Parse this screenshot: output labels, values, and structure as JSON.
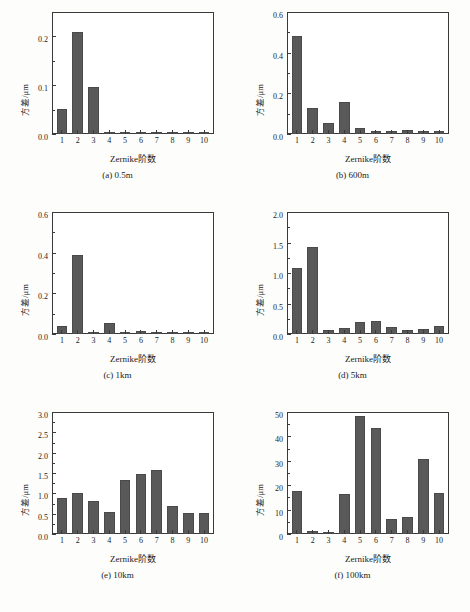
{
  "figure": {
    "background": "#fdfdfc",
    "bar_color": "#595959",
    "axis_color": "#3a3a3a",
    "xlabel": "Zernike阶数",
    "ylabel": "方差/μm",
    "caption": ""
  },
  "chart_data": [
    {
      "type": "bar",
      "panel": "(a)",
      "subcaption": "(a) 0.5m",
      "title": "",
      "xlabel": "Zernike阶数",
      "ylabel": "方差/μm",
      "categories": [
        "1",
        "2",
        "3",
        "4",
        "5",
        "6",
        "7",
        "8",
        "9",
        "10"
      ],
      "values": [
        0.051,
        0.21,
        0.097,
        0.0,
        0.002,
        0.0,
        0.0,
        0.0,
        0.0,
        0.0
      ],
      "ylim": [
        0,
        0.25
      ],
      "yticks": [
        0.0,
        0.1,
        0.2
      ],
      "yticklabels": [
        "0.0",
        "0.1",
        "0.2"
      ],
      "yminor": [
        0.05,
        0.15,
        0.25
      ],
      "grid": false,
      "legend": "none"
    },
    {
      "type": "bar",
      "panel": "(b)",
      "subcaption": "(b) 600m",
      "title": "",
      "xlabel": "Zernike阶数",
      "ylabel": "方差/μm",
      "categories": [
        "1",
        "2",
        "3",
        "4",
        "5",
        "6",
        "7",
        "8",
        "9",
        "10"
      ],
      "values": [
        0.48,
        0.128,
        0.052,
        0.156,
        0.031,
        0.017,
        0.016,
        0.022,
        0.013,
        0.013
      ],
      "ylim": [
        0,
        0.6
      ],
      "yticks": [
        0.0,
        0.2,
        0.4,
        0.6
      ],
      "yticklabels": [
        "0.0",
        "0.2",
        "0.4",
        "0.6"
      ],
      "yminor": [
        0.1,
        0.3,
        0.5
      ],
      "grid": false,
      "legend": "none"
    },
    {
      "type": "bar",
      "panel": "(c)",
      "subcaption": "(c) 1km",
      "title": "",
      "xlabel": "Zernike阶数",
      "ylabel": "方差/μm",
      "categories": [
        "1",
        "2",
        "3",
        "4",
        "5",
        "6",
        "7",
        "8",
        "9",
        "10"
      ],
      "values": [
        0.038,
        0.387,
        0.003,
        0.053,
        0.011,
        0.017,
        0.005,
        0.0,
        0.0,
        0.0
      ],
      "ylim": [
        0,
        0.6
      ],
      "yticks": [
        0.0,
        0.2,
        0.4,
        0.6
      ],
      "yticklabels": [
        "0.0",
        "0.2",
        "0.4",
        "0.6"
      ],
      "yminor": [
        0.1,
        0.3,
        0.5
      ],
      "grid": false,
      "legend": "none"
    },
    {
      "type": "bar",
      "panel": "(d)",
      "subcaption": "(d) 5km",
      "title": "",
      "xlabel": "Zernike阶数",
      "ylabel": "方差/μm",
      "categories": [
        "1",
        "2",
        "3",
        "4",
        "5",
        "6",
        "7",
        "8",
        "9",
        "10"
      ],
      "values": [
        1.09,
        1.43,
        0.065,
        0.095,
        0.19,
        0.22,
        0.12,
        0.065,
        0.085,
        0.135
      ],
      "ylim": [
        0,
        2.0
      ],
      "yticks": [
        0.0,
        0.5,
        1.0,
        1.5,
        2.0
      ],
      "yticklabels": [
        "0.0",
        "0.5",
        "1.0",
        "1.5",
        "2.0"
      ],
      "yminor": [
        0.25,
        0.75,
        1.25,
        1.75
      ],
      "grid": false,
      "legend": "none"
    },
    {
      "type": "bar",
      "panel": "(e)",
      "subcaption": "(e) 10km",
      "title": "",
      "xlabel": "Zernike阶数",
      "ylabel": "方差/μm",
      "categories": [
        "1",
        "2",
        "3",
        "4",
        "5",
        "6",
        "7",
        "8",
        "9",
        "10"
      ],
      "values": [
        0.88,
        1.01,
        0.8,
        0.53,
        1.32,
        1.48,
        1.57,
        0.7,
        0.52,
        0.51
      ],
      "ylim": [
        0,
        3.0
      ],
      "yticks": [
        0.0,
        0.5,
        1.0,
        1.5,
        2.0,
        2.5,
        3.0
      ],
      "yticklabels": [
        "0.0",
        "0.5",
        "1.0",
        "1.5",
        "2.0",
        "2.5",
        "3.0"
      ],
      "yminor": [
        0.25,
        0.75,
        1.25,
        1.75,
        2.25,
        2.75
      ],
      "grid": false,
      "legend": "none"
    },
    {
      "type": "bar",
      "panel": "(f)",
      "subcaption": "(f) 100km",
      "title": "",
      "xlabel": "Zernike阶数",
      "ylabel": "方差/μm",
      "categories": [
        "1",
        "2",
        "3",
        "4",
        "5",
        "6",
        "7",
        "8",
        "9",
        "10"
      ],
      "values": [
        17.5,
        1.2,
        0.3,
        16.2,
        48.2,
        43.3,
        6.3,
        7.1,
        30.9,
        16.9
      ],
      "ylim": [
        0,
        50
      ],
      "yticks": [
        0,
        10,
        20,
        30,
        40,
        50
      ],
      "yticklabels": [
        "0",
        "10",
        "20",
        "30",
        "40",
        "50"
      ],
      "yminor": [
        5,
        15,
        25,
        35,
        45
      ],
      "grid": false,
      "legend": "none"
    }
  ]
}
